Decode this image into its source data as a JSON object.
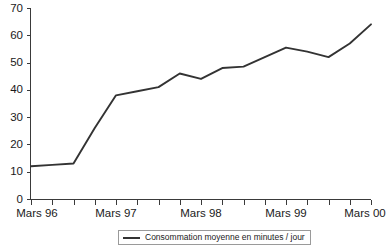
{
  "chart_data": {
    "type": "line",
    "title": "",
    "subtitle": "",
    "xlabel": "",
    "ylabel": "",
    "ylim": [
      0,
      70
    ],
    "ytick_values": [
      0,
      10,
      20,
      30,
      40,
      50,
      60,
      70
    ],
    "ytick_labels": [
      "0",
      "10",
      "20",
      "30",
      "40",
      "50",
      "60",
      "70"
    ],
    "xtick_labels": [
      "Mars 96",
      "Mars 97",
      "Mars 98",
      "Mars 99",
      "Mars 00"
    ],
    "xtick_positions": [
      0,
      4,
      8,
      12,
      16
    ],
    "minor_tick_count": 17,
    "grid": false,
    "legend_position": "bottom-center",
    "series": [
      {
        "name": "Consommation moyenne en minutes / jour",
        "color": "#333333",
        "x": [
          0,
          1,
          2,
          3,
          4,
          5,
          6,
          7,
          8,
          9,
          10,
          11,
          12,
          13,
          14,
          15,
          16
        ],
        "values": [
          12,
          12.5,
          13,
          26,
          38,
          39.5,
          41,
          46,
          44,
          48,
          48.5,
          52,
          55.5,
          54,
          52,
          57,
          64
        ]
      }
    ]
  }
}
